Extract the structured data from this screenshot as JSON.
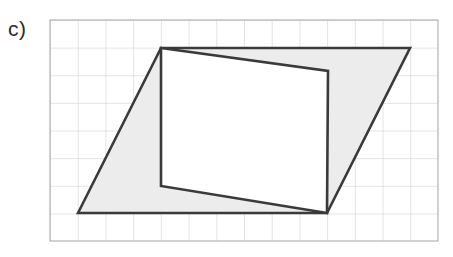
{
  "figure": {
    "label": "c)",
    "caption_label_name": "part-label-c",
    "canvas": {
      "width": 453,
      "height": 257,
      "background": "#ffffff"
    },
    "grid": {
      "x": 50,
      "y": 20,
      "width": 388,
      "height": 221,
      "columns": 14,
      "rows": 8,
      "cell_width": 27.71,
      "cell_height": 27.63,
      "line_color": "#c9c9c9",
      "border_color": "#b5b5b5",
      "line_width": 1,
      "fill": "#ffffff"
    },
    "shapes": [
      {
        "name": "outer-parallelogram",
        "type": "polygon",
        "points": [
          [
            78,
            213
          ],
          [
            161,
            48
          ],
          [
            410,
            48
          ],
          [
            327,
            213
          ]
        ],
        "grid_points": [
          [
            1,
            7
          ],
          [
            4,
            1
          ],
          [
            13,
            1
          ],
          [
            10,
            7
          ]
        ],
        "fill": "#ececec",
        "stroke": "#3a3a3a",
        "stroke_width": 2.6
      },
      {
        "name": "inner-quadrilateral",
        "type": "polygon",
        "points": [
          [
            161,
            48
          ],
          [
            328,
            71
          ],
          [
            327,
            213
          ],
          [
            161,
            186
          ]
        ],
        "grid_points": [
          [
            4,
            1
          ],
          [
            10.03,
            1.85
          ],
          [
            10,
            7
          ],
          [
            4,
            6
          ]
        ],
        "fill": "#ffffff",
        "stroke": "#3a3a3a",
        "stroke_width": 2.6
      }
    ]
  },
  "chart_data": {
    "type": "diagram",
    "title": "c)",
    "grid": {
      "columns": 14,
      "rows": 8,
      "cell_size_units": 1
    },
    "series": [
      {
        "name": "outer parallelogram",
        "vertices_grid": [
          [
            1,
            7
          ],
          [
            4,
            1
          ],
          [
            13,
            1
          ],
          [
            10,
            7
          ]
        ],
        "shaded": true
      },
      {
        "name": "inscribed quadrilateral",
        "vertices_grid": [
          [
            4,
            1
          ],
          [
            10,
            1.85
          ],
          [
            10,
            7
          ],
          [
            4,
            6
          ]
        ],
        "shaded": false
      }
    ],
    "xlabel": "",
    "ylabel": "",
    "legend": []
  }
}
